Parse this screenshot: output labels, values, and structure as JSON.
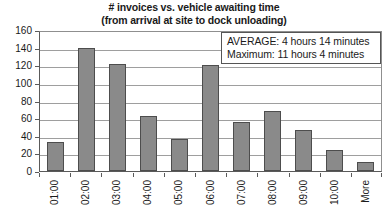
{
  "chart_data": {
    "type": "bar",
    "title": "# invoices vs. vehicle awaiting time",
    "subtitle": "(from arrival at site to dock unloading)",
    "xlabel": "",
    "ylabel": "",
    "ylim": [
      0,
      160
    ],
    "ytick_step": 20,
    "grid": true,
    "legend": "none",
    "categories": [
      "01:00",
      "02:00",
      "03:00",
      "04:00",
      "05:00",
      "06:00",
      "07:00",
      "08:00",
      "09:00",
      "10:00",
      "More"
    ],
    "values": [
      33,
      140,
      122,
      62,
      36,
      120,
      56,
      68,
      47,
      24,
      10
    ],
    "ytick_labels": [
      "160",
      "140",
      "120",
      "100",
      "80",
      "60",
      "40",
      "20",
      "0"
    ],
    "annotations": [
      "AVERAGE: 4 hours 14 minutes",
      "Maximum: 11 hours 4 minutes"
    ],
    "colors": {
      "bar_fill": "#8a8a8a",
      "bar_border": "#4d4d4d",
      "gridline": "#9e9e9e",
      "axis": "#5a5a5a",
      "text": "#1a1a1a",
      "background": "#ffffff"
    }
  }
}
